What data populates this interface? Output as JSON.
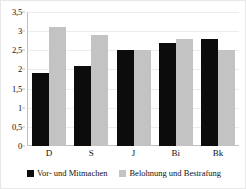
{
  "chart_data": {
    "type": "bar",
    "title": "",
    "xlabel": "",
    "ylabel": "",
    "categories": [
      "D",
      "S",
      "J",
      "Bi",
      "Bk"
    ],
    "series": [
      {
        "name": "Vor- und Mitmachen",
        "color": "#0c0c0c",
        "values": [
          1.9,
          2.1,
          2.5,
          2.7,
          2.8
        ]
      },
      {
        "name": "Belohnung und Bestrafung",
        "color": "#c3c3c3",
        "values": [
          3.1,
          2.9,
          2.5,
          2.8,
          2.5
        ]
      }
    ],
    "ylim": [
      0,
      3.5
    ],
    "ytick_labels": [
      "3,5",
      "3",
      "2,5",
      "2",
      "1,5",
      "1",
      "0,5",
      "0"
    ],
    "ytick_values": [
      3.5,
      3,
      2.5,
      2,
      1.5,
      1,
      0.5,
      0
    ],
    "grid": true,
    "legend_position": "bottom"
  },
  "legend": {
    "items": [
      {
        "label": "Vor- und Mitmachen",
        "swatch": "series-a"
      },
      {
        "label": "Belohnung und Bestrafung",
        "swatch": "series-b"
      }
    ]
  }
}
